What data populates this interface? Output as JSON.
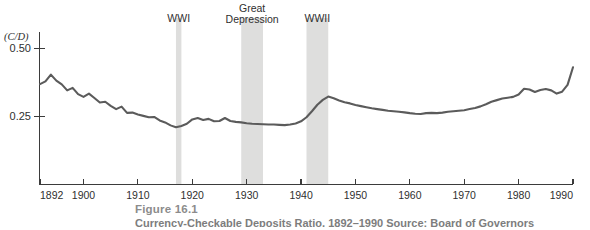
{
  "figure": {
    "caption_title": "Figure 16.1",
    "caption_subtitle": "Currency-Checkable Deposits Ratio, 1892–1990 Source: Board of Governors"
  },
  "chart_data": {
    "type": "line",
    "title": "",
    "xlabel": "",
    "ylabel": "(C/D)",
    "ylabel_display": "(C/D)",
    "xlim": [
      1892,
      1990
    ],
    "ylim": [
      0.0,
      0.56
    ],
    "grid": false,
    "legend": "none",
    "y_ticks": [
      0.25,
      0.5
    ],
    "y_tick_labels": [
      "0.25",
      "0.50"
    ],
    "x_ticks": [
      1892,
      1900,
      1910,
      1920,
      1930,
      1940,
      1950,
      1960,
      1970,
      1980,
      1990
    ],
    "x_tick_labels": [
      "1892",
      "1900",
      "1910",
      "1920",
      "1930",
      "1940",
      "1950",
      "1960",
      "1970",
      "1980",
      "1990"
    ],
    "series_name": "Currency to checkable deposits ratio",
    "line_color": "#5b5b5b",
    "band_color": "#dededd",
    "x": [
      1892,
      1893,
      1894,
      1895,
      1896,
      1897,
      1898,
      1899,
      1900,
      1901,
      1902,
      1903,
      1904,
      1905,
      1906,
      1907,
      1908,
      1909,
      1910,
      1911,
      1912,
      1913,
      1914,
      1915,
      1916,
      1917,
      1918,
      1919,
      1920,
      1921,
      1922,
      1923,
      1924,
      1925,
      1926,
      1927,
      1928,
      1929,
      1930,
      1931,
      1932,
      1933,
      1934,
      1935,
      1936,
      1937,
      1938,
      1939,
      1940,
      1941,
      1942,
      1943,
      1944,
      1945,
      1946,
      1947,
      1948,
      1949,
      1950,
      1951,
      1952,
      1953,
      1954,
      1955,
      1956,
      1957,
      1958,
      1959,
      1960,
      1961,
      1962,
      1963,
      1964,
      1965,
      1966,
      1967,
      1968,
      1969,
      1970,
      1971,
      1972,
      1973,
      1974,
      1975,
      1976,
      1977,
      1978,
      1979,
      1980,
      1981,
      1982,
      1983,
      1984,
      1985,
      1986,
      1987,
      1988,
      1989,
      1990
    ],
    "values": [
      0.368,
      0.378,
      0.403,
      0.381,
      0.367,
      0.345,
      0.354,
      0.331,
      0.321,
      0.333,
      0.317,
      0.3,
      0.303,
      0.288,
      0.276,
      0.285,
      0.262,
      0.263,
      0.256,
      0.251,
      0.246,
      0.247,
      0.234,
      0.227,
      0.216,
      0.209,
      0.214,
      0.222,
      0.238,
      0.243,
      0.236,
      0.24,
      0.231,
      0.232,
      0.243,
      0.232,
      0.229,
      0.227,
      0.224,
      0.222,
      0.221,
      0.22,
      0.219,
      0.219,
      0.218,
      0.217,
      0.219,
      0.223,
      0.231,
      0.246,
      0.268,
      0.292,
      0.31,
      0.322,
      0.316,
      0.308,
      0.301,
      0.297,
      0.291,
      0.287,
      0.283,
      0.279,
      0.276,
      0.273,
      0.27,
      0.268,
      0.266,
      0.264,
      0.261,
      0.259,
      0.258,
      0.261,
      0.262,
      0.261,
      0.263,
      0.266,
      0.268,
      0.27,
      0.272,
      0.276,
      0.28,
      0.286,
      0.294,
      0.303,
      0.309,
      0.315,
      0.318,
      0.321,
      0.33,
      0.351,
      0.348,
      0.339,
      0.346,
      0.35,
      0.345,
      0.333,
      0.34,
      0.365,
      0.43
    ],
    "annotations": [
      {
        "label": "WWI",
        "label_lines": [
          "WWI"
        ],
        "start": 1917,
        "end": 1918
      },
      {
        "label": "Great Depression",
        "label_lines": [
          "Great",
          "Depression"
        ],
        "start": 1929,
        "end": 1933
      },
      {
        "label": "WWII",
        "label_lines": [
          "WWII"
        ],
        "start": 1941,
        "end": 1945
      }
    ]
  }
}
